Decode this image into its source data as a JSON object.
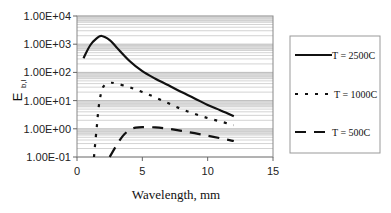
{
  "chart_data": {
    "type": "line",
    "title": "",
    "xlabel": "Wavelength, mm",
    "ylabel": "E",
    "ylabel_subscript": "b,l",
    "xlim": [
      0,
      15
    ],
    "ylim": [
      0.1,
      10000
    ],
    "yscale": "log",
    "x_ticks": [
      "0",
      "5",
      "10",
      "15"
    ],
    "y_ticks": [
      "1.00E+04",
      "1.00E+03",
      "1.00E+02",
      "1.00E+01",
      "1.00E+00",
      "1.00E-01"
    ],
    "grid": "horizontal log minor gridlines",
    "legend_position": "right",
    "series": [
      {
        "name": "T = 2500C",
        "style": "solid",
        "x": [
          0.5,
          1.0,
          1.5,
          1.9,
          2.5,
          3.0,
          4.0,
          5.0,
          6.0,
          7.0,
          8.0,
          9.0,
          10.0,
          11.0,
          12.0
        ],
        "y": [
          320,
          900,
          1600,
          1950,
          1400,
          800,
          260,
          110,
          60,
          35,
          20,
          12,
          7,
          4.5,
          2.8
        ]
      },
      {
        "name": "T = 1000C",
        "style": "dotted",
        "x": [
          1.3,
          1.5,
          1.7,
          2.0,
          2.5,
          3.0,
          4.0,
          5.0,
          6.0,
          7.0,
          8.0,
          9.0,
          10.0,
          11.0,
          12.0
        ],
        "y": [
          0.1,
          1.0,
          8,
          30,
          42,
          40,
          30,
          20,
          13,
          8,
          5,
          3.4,
          2.4,
          1.8,
          1.35
        ]
      },
      {
        "name": "T = 500C",
        "style": "dashed",
        "x": [
          2.5,
          3.0,
          3.5,
          4.0,
          4.5,
          5.0,
          6.0,
          7.0,
          8.0,
          9.0,
          10.0,
          11.0,
          12.0
        ],
        "y": [
          0.1,
          0.25,
          0.55,
          0.9,
          1.1,
          1.15,
          1.12,
          1.0,
          0.85,
          0.7,
          0.57,
          0.46,
          0.37
        ]
      }
    ]
  },
  "legend": {
    "items": [
      {
        "label": "T = 2500C",
        "style": "solid"
      },
      {
        "label": "T = 1000C",
        "style": "dotted"
      },
      {
        "label": "T = 500C",
        "style": "dashed"
      }
    ]
  },
  "colors": {
    "line": "#111111",
    "grid": "#c8c8c8",
    "band": "#e6e6e6",
    "axis": "#666666"
  }
}
